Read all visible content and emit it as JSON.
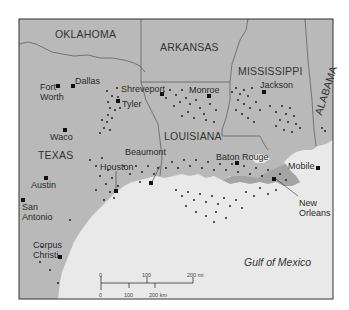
{
  "map": {
    "title": "",
    "colors": {
      "land": "#b9b9b9",
      "wetland": "#a7a7a7",
      "water": "#e9e9e9",
      "border": "#555555",
      "frame": "#333333",
      "well_dot": "#222222",
      "city_marker": "#111111"
    },
    "states": [
      {
        "name": "OKLAHOMA"
      },
      {
        "name": "ARKANSAS"
      },
      {
        "name": "MISSISSIPPI"
      },
      {
        "name": "ALABAMA"
      },
      {
        "name": "LOUISIANA"
      },
      {
        "name": "TEXAS"
      }
    ],
    "cities": [
      {
        "name": "Dallas"
      },
      {
        "name": "Fort Worth",
        "line1": "Fort",
        "line2": "Worth"
      },
      {
        "name": "Shreveport"
      },
      {
        "name": "Tyler"
      },
      {
        "name": "Monroe"
      },
      {
        "name": "Jackson"
      },
      {
        "name": "Waco"
      },
      {
        "name": "Beaumont"
      },
      {
        "name": "Houston"
      },
      {
        "name": "Baton Rouge"
      },
      {
        "name": "Mobile"
      },
      {
        "name": "Austin"
      },
      {
        "name": "San Antonio",
        "line1": "San",
        "line2": "Antonio"
      },
      {
        "name": "New Orleans",
        "line1": "New",
        "line2": "Orleans"
      },
      {
        "name": "Corpus Christi",
        "line1": "Corpus",
        "line2": "Christi"
      }
    ],
    "water_body": "Gulf of Mexico",
    "scale_bar": {
      "miles": {
        "ticks": [
          "0",
          "100",
          "200 mi"
        ]
      },
      "km": {
        "ticks": [
          "0",
          "100",
          "200 km"
        ]
      }
    }
  }
}
